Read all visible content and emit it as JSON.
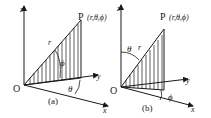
{
  "figure_a": {
    "caption": "(a)",
    "origin": "O",
    "axis_z": "z",
    "axis_y": "y",
    "axis_x": "x",
    "point_label": "P",
    "point_coords": "(r,θ,ϕ)",
    "radius_label": "r",
    "angle_phi": "ϕ",
    "angle_theta": "θ"
  },
  "figure_b": {
    "caption": "(b)",
    "origin": "O",
    "axis_z": "z",
    "axis_y": "y",
    "axis_x": "x",
    "point_label": "P",
    "point_coords": "(r,θ,ϕ)",
    "radius_label": "r",
    "angle_theta": "θ",
    "angle_phi": "ϕ"
  },
  "colors": {
    "ink": "#1a1a1a",
    "background": "#ffffff"
  }
}
